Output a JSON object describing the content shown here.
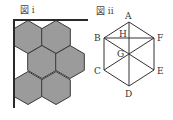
{
  "figure_i": {
    "label": "図 i",
    "label_pos": [
      20,
      13
    ],
    "fill_color": "#9b9b9b",
    "edge_color": "#3a3a3a",
    "frame": {
      "corner": [
        14,
        20
      ],
      "right_end": 88,
      "bottom_end": 108
    },
    "hexagon_radius": 16.5,
    "hexagons": [
      {
        "cx": 28,
        "cy": 37
      },
      {
        "cx": 56,
        "cy": 37
      },
      {
        "cx": 42,
        "cy": 62
      },
      {
        "cx": 70,
        "cy": 62
      },
      {
        "cx": 28,
        "cy": 88
      },
      {
        "cx": 56,
        "cy": 88
      }
    ]
  },
  "figure_ii": {
    "label": "図 ii",
    "label_pos": [
      96,
      14
    ],
    "points": {
      "A": {
        "x": 129,
        "y": 22,
        "label_dx": -4,
        "label_dy": -3
      },
      "B": {
        "x": 104,
        "y": 38,
        "label_dx": -10,
        "label_dy": 3
      },
      "C": {
        "x": 104,
        "y": 70,
        "label_dx": -10,
        "label_dy": 4
      },
      "D": {
        "x": 129,
        "y": 86,
        "label_dx": -4,
        "label_dy": 11
      },
      "E": {
        "x": 154,
        "y": 70,
        "label_dx": 3,
        "label_dy": 4
      },
      "F": {
        "x": 154,
        "y": 38,
        "label_dx": 3,
        "label_dy": 3
      },
      "G": {
        "x": 129,
        "y": 54,
        "label_dx": -12,
        "label_dy": 3
      },
      "H": {
        "x": 129,
        "y": 38,
        "label_dx": -10,
        "label_dy": -1
      }
    },
    "outline": [
      "A",
      "B",
      "C",
      "D",
      "E",
      "F"
    ],
    "segments": [
      [
        "B",
        "F"
      ],
      [
        "A",
        "D"
      ],
      [
        "B",
        "E"
      ],
      [
        "C",
        "F"
      ]
    ]
  }
}
